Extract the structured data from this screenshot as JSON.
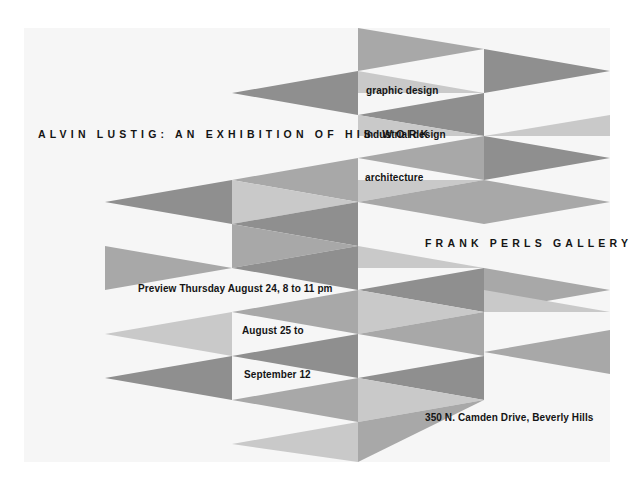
{
  "poster": {
    "title": "ALVIN LUSTIG: AN EXHIBITION OF HIS WORK",
    "disciplines": [
      "graphic design",
      "industrial design",
      "architecture"
    ],
    "gallery": "FRANK PERLS GALLERY",
    "preview": "Preview Thursday August 24, 8 to 11 pm",
    "dates": {
      "start": "August 25 to",
      "end": "September 12"
    },
    "address": "350 N. Camden Drive, Beverly Hills"
  },
  "palette": {
    "page": "#ffffff",
    "card": "#f6f6f6",
    "dark": "#8f8f8f",
    "mid": "#a8a8a8",
    "light": "#c9c9c9",
    "ink": "#141414"
  }
}
